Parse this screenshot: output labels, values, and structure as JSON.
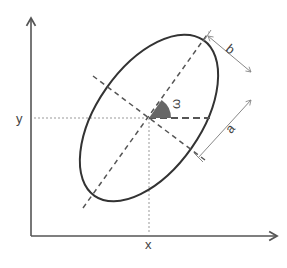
{
  "diagram": {
    "type": "rotated-ellipse-parameters",
    "labels": {
      "x_axis": "x",
      "y_axis": "y",
      "angle": "ω",
      "semi_major": "a",
      "semi_minor": "b"
    },
    "colors": {
      "axis": "#555555",
      "ellipse": "#333333",
      "dashed": "#555555",
      "guide": "#999999",
      "wedge": "#666666",
      "dimension": "#888888"
    },
    "ellipse": {
      "center": [
        149,
        118
      ],
      "semi_major_px": 95,
      "semi_minor_px": 52,
      "rotation_deg": -55
    }
  }
}
